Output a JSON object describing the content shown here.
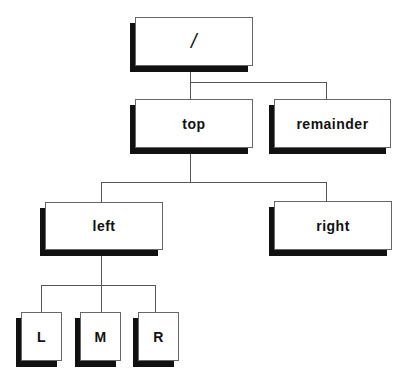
{
  "diagram": {
    "type": "tree",
    "nodes": [
      {
        "id": "root",
        "label": "/",
        "x": 135,
        "y": 17,
        "w": 118,
        "h": 49
      },
      {
        "id": "top",
        "label": "top",
        "x": 135,
        "y": 99,
        "w": 118,
        "h": 49
      },
      {
        "id": "remainder",
        "label": "remainder",
        "x": 274,
        "y": 99,
        "w": 117,
        "h": 49
      },
      {
        "id": "left",
        "label": "left",
        "x": 45,
        "y": 202,
        "w": 118,
        "h": 48
      },
      {
        "id": "right",
        "label": "right",
        "x": 274,
        "y": 201,
        "w": 118,
        "h": 49
      },
      {
        "id": "L",
        "label": "L",
        "x": 21,
        "y": 312,
        "w": 41,
        "h": 49
      },
      {
        "id": "M",
        "label": "M",
        "x": 80,
        "y": 312,
        "w": 41,
        "h": 49
      },
      {
        "id": "R",
        "label": "R",
        "x": 138,
        "y": 312,
        "w": 41,
        "h": 49
      }
    ],
    "edges": [
      {
        "from": "root",
        "to": "top"
      },
      {
        "from": "root",
        "to": "remainder"
      },
      {
        "from": "top",
        "to": "left"
      },
      {
        "from": "top",
        "to": "right"
      },
      {
        "from": "left",
        "to": "L"
      },
      {
        "from": "left",
        "to": "M"
      },
      {
        "from": "left",
        "to": "R"
      }
    ]
  }
}
